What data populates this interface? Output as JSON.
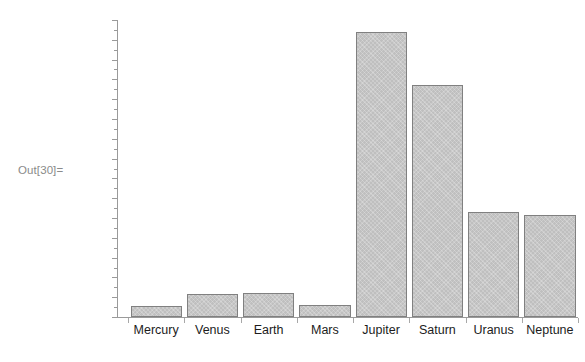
{
  "notebook": {
    "out_label": "Out[30]="
  },
  "style": {
    "bar_fill": "#bfbfbf",
    "bar_edge": "#808080",
    "axis_color": "#9a9a9a",
    "label_color": "#1c1c1c",
    "out_label_color": "#8a8a8a",
    "background": "#ffffff"
  },
  "chart_data": {
    "type": "bar",
    "title": "",
    "xlabel": "",
    "ylabel": "",
    "legend": null,
    "grid": false,
    "axis": {
      "y_tick_labels": [],
      "x_tick_labels": [
        "Mercury",
        "Venus",
        "Earth",
        "Mars",
        "Jupiter",
        "Saturn",
        "Uranus",
        "Neptune"
      ],
      "ylim": [
        0,
        1.0
      ],
      "y_major_ticks": 15,
      "y_minor_ticks_between": 1
    },
    "categories": [
      "Mercury",
      "Venus",
      "Earth",
      "Mars",
      "Jupiter",
      "Saturn",
      "Uranus",
      "Neptune"
    ],
    "values": [
      0.038,
      0.078,
      0.081,
      0.041,
      0.959,
      0.781,
      0.354,
      0.344
    ],
    "bar_pixel_tops": [
      306,
      294,
      293,
      305,
      32,
      85,
      212,
      215
    ],
    "bar_baseline_pixel": 317
  }
}
